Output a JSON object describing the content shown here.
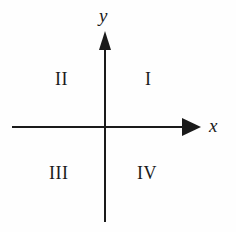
{
  "figure": {
    "type": "cartesian-coordinate-plane",
    "background_color": "#fefefe",
    "stroke_color": "#1a1a1a"
  },
  "axes": {
    "x": {
      "label": "x",
      "icon": "arrow-right-icon",
      "direction": "right"
    },
    "y": {
      "label": "y",
      "icon": "arrow-up-icon",
      "direction": "up"
    },
    "origin_label": ""
  },
  "quadrants": [
    {
      "id": "I",
      "label": "I",
      "position": "top-right"
    },
    {
      "id": "II",
      "label": "II",
      "position": "top-left"
    },
    {
      "id": "III",
      "label": "III",
      "position": "bottom-left"
    },
    {
      "id": "IV",
      "label": "IV",
      "position": "bottom-right"
    }
  ]
}
